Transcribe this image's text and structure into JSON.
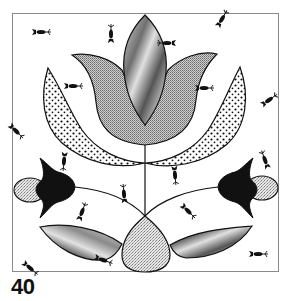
{
  "plate": {
    "number": "40",
    "title": "Folk-art tulip applique pattern"
  },
  "colors": {
    "background": "#ffffff",
    "frame": "#8a8a8a",
    "outline": "#111111",
    "ink": "#111111",
    "screen_gray": "#b8b8b8",
    "stipple_gray": "#d4d4d4",
    "marble_gray": "#9c9c9c"
  },
  "motifs": [
    {
      "name": "center-pod",
      "fill": "marbled"
    },
    {
      "name": "tulip-petals",
      "fill": "screened"
    },
    {
      "name": "left-crescent-leaf",
      "fill": "dotted"
    },
    {
      "name": "right-crescent-leaf",
      "fill": "dotted"
    },
    {
      "name": "left-bell-flower",
      "fill": "solid-black"
    },
    {
      "name": "left-bud",
      "fill": "stippled"
    },
    {
      "name": "right-bell-flower",
      "fill": "solid-black"
    },
    {
      "name": "right-bud",
      "fill": "stippled"
    },
    {
      "name": "bottom-teardrop",
      "fill": "stippled"
    },
    {
      "name": "bottom-left-leaf",
      "fill": "marbled"
    },
    {
      "name": "bottom-right-leaf",
      "fill": "marbled"
    },
    {
      "name": "birds",
      "count": 12
    }
  ]
}
